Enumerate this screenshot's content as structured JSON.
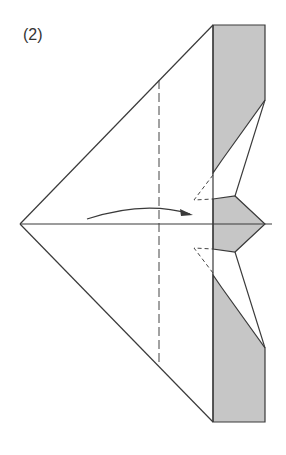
{
  "figure": {
    "step_label": "(2)",
    "colors": {
      "line": "#3a3a3a",
      "shaded_paper": "#c6c6c6",
      "background": "#ffffff"
    },
    "elements": [
      "outline",
      "center-crease",
      "fold-line-dashed",
      "fold-arrow",
      "shaded-top-flap",
      "shaded-bottom-flap",
      "shaded-nose-piece",
      "hidden-edges-dashed"
    ]
  }
}
